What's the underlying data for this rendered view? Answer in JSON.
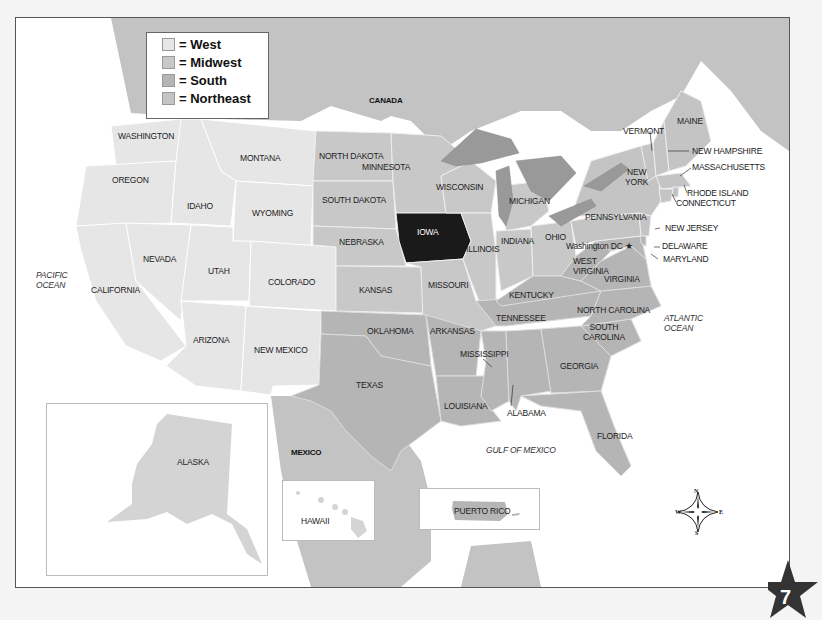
{
  "legend": {
    "items": [
      {
        "label": "= West",
        "color": "#e6e6e6"
      },
      {
        "label": "= Midwest",
        "color": "#c8c8c8"
      },
      {
        "label": "= South",
        "color": "#b5b5b5"
      },
      {
        "label": "= Northeast",
        "color": "#c4c4c4"
      }
    ]
  },
  "highlight": {
    "state": "IOWA",
    "color": "#1a1a1a"
  },
  "countries": {
    "canada": "CANADA",
    "mexico": "MEXICO"
  },
  "oceans": {
    "pacific": [
      "PACIFIC",
      "OCEAN"
    ],
    "atlantic": [
      "ATLANTIC",
      "OCEAN"
    ],
    "gulf": "GULF OF MEXICO"
  },
  "states": {
    "washington": "WASHINGTON",
    "oregon": "OREGON",
    "california": "CALIFORNIA",
    "idaho": "IDAHO",
    "nevada": "NEVADA",
    "montana": "MONTANA",
    "wyoming": "WYOMING",
    "utah": "UTAH",
    "colorado": "COLORADO",
    "arizona": "ARIZONA",
    "new_mexico": "NEW MEXICO",
    "north_dakota": "NORTH DAKOTA",
    "south_dakota": "SOUTH DAKOTA",
    "nebraska": "NEBRASKA",
    "kansas": "KANSAS",
    "minnesota": "MINNESOTA",
    "iowa": "IOWA",
    "missouri": "MISSOURI",
    "wisconsin": "WISCONSIN",
    "illinois": "ILLINOIS",
    "michigan": "MICHIGAN",
    "indiana": "INDIANA",
    "ohio": "OHIO",
    "oklahoma": "OKLAHOMA",
    "texas": "TEXAS",
    "arkansas": "ARKANSAS",
    "louisiana": "LOUISIANA",
    "mississippi": "MISSISSIPPI",
    "alabama": "ALABAMA",
    "tennessee": "TENNESSEE",
    "kentucky": "KENTUCKY",
    "georgia": "GEORGIA",
    "florida": "FLORIDA",
    "south_carolina": [
      "SOUTH",
      "CAROLINA"
    ],
    "north_carolina": "NORTH CAROLINA",
    "virginia": "VIRGINIA",
    "west_virginia": [
      "WEST",
      "VIRGINIA"
    ],
    "maryland": "MARYLAND",
    "delaware": "DELAWARE",
    "new_jersey": "NEW JERSEY",
    "pennsylvania": "PENNSYLVANIA",
    "new_york": [
      "NEW",
      "YORK"
    ],
    "connecticut": "CONNECTICUT",
    "rhode_island": "RHODE ISLAND",
    "massachusetts": "MASSACHUSETTS",
    "vermont": "VERMONT",
    "new_hampshire": "NEW HAMPSHIRE",
    "maine": "MAINE",
    "alaska": "ALASKA",
    "hawaii": "HAWAII",
    "puerto_rico": "PUERTO RICO"
  },
  "capital": {
    "label": "Washington DC",
    "marker": "★"
  },
  "compass": {
    "n": "N",
    "s": "S",
    "e": "E",
    "w": "W"
  },
  "page_number": "7"
}
